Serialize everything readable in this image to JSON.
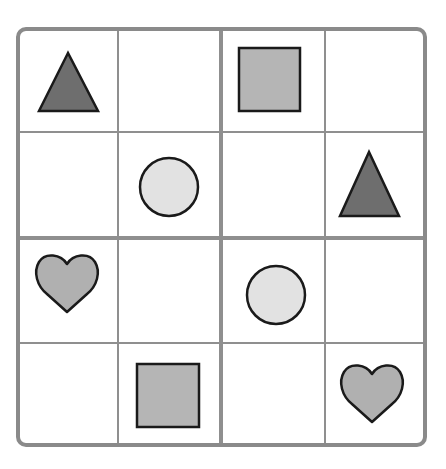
{
  "puzzle": {
    "type": "4x4 shape sudoku",
    "rows": 4,
    "cols": 4,
    "colors": {
      "border": "#8a8a8a",
      "gridline": "#8f8f8f",
      "outline": "#1a1a1a",
      "triangle_fill": "#6e6e6e",
      "square_fill": "#b5b5b5",
      "circle_fill": "#e2e2e2",
      "heart_fill": "#b0b0b0"
    },
    "grid": [
      [
        "triangle",
        "",
        "square",
        ""
      ],
      [
        "",
        "circle",
        "",
        "triangle"
      ],
      [
        "heart",
        "",
        "circle",
        ""
      ],
      [
        "",
        "square",
        "",
        "heart"
      ]
    ]
  }
}
